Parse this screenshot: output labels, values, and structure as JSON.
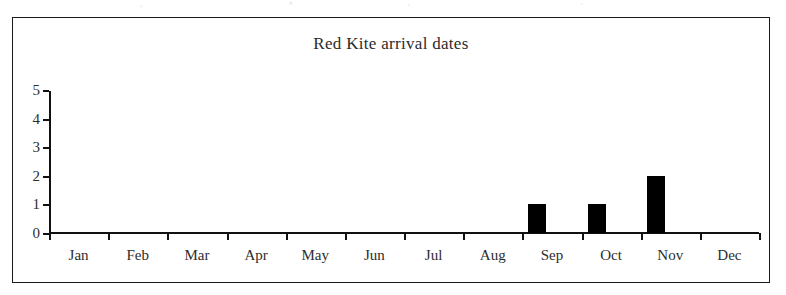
{
  "chart_data": {
    "type": "bar",
    "title": "Red Kite arrival dates",
    "xlabel": "",
    "ylabel": "",
    "categories": [
      "Jan",
      "Feb",
      "Mar",
      "Apr",
      "May",
      "Jun",
      "Jul",
      "Aug",
      "Sep",
      "Oct",
      "Nov",
      "Dec"
    ],
    "values": [
      0,
      0,
      0,
      0,
      0,
      0,
      0,
      0,
      1,
      1,
      2,
      0
    ],
    "ylim": [
      0,
      5
    ],
    "ytick_labels": [
      "0",
      "1",
      "2",
      "3",
      "4",
      "5"
    ],
    "yticks": [
      0,
      1,
      2,
      3,
      4,
      5
    ],
    "grid": false,
    "legend": false,
    "bar_color": "#000000",
    "axis_color": "#111111",
    "background_color": "#ffffff",
    "border_color": "#1a1a1a"
  }
}
